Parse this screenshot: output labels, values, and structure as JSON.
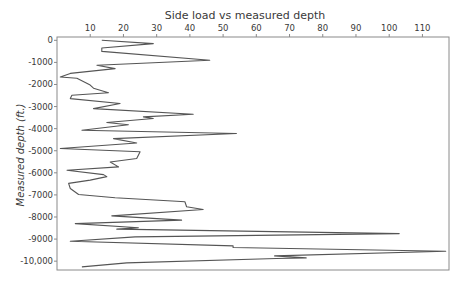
{
  "chart_data": {
    "type": "line",
    "title": "Side load vs measured depth",
    "xlabel": "",
    "ylabel": "Measured depth (ft.)",
    "xlim": [
      0,
      118
    ],
    "ylim": [
      -10400,
      150
    ],
    "x_axis_position": "top",
    "grid": false,
    "x_ticks": [
      10,
      20,
      30,
      40,
      50,
      60,
      70,
      80,
      90,
      100,
      110
    ],
    "x_tick_labels": [
      "10",
      "20",
      "30",
      "40",
      "50",
      "60",
      "70",
      "80",
      "90",
      "100",
      "110"
    ],
    "y_ticks": [
      0,
      -1000,
      -2000,
      -3000,
      -4000,
      -5000,
      -6000,
      -7000,
      -8000,
      -9000,
      -10000
    ],
    "y_tick_labels": [
      "0",
      "-1000",
      "-2000",
      "-3000",
      "-4000",
      "-5000",
      "-6000",
      "-7000",
      "-8000",
      "-9000",
      "-10,000"
    ],
    "series": [
      {
        "name": "Side load",
        "color": "#555555",
        "points": [
          [
            13.5,
            0
          ],
          [
            29,
            -150
          ],
          [
            13.5,
            -350
          ],
          [
            13.5,
            -500
          ],
          [
            46,
            -900
          ],
          [
            12,
            -1130
          ],
          [
            17.5,
            -1280
          ],
          [
            4,
            -1500
          ],
          [
            1,
            -1660
          ],
          [
            6,
            -1720
          ],
          [
            10,
            -2030
          ],
          [
            11,
            -2170
          ],
          [
            15.5,
            -2370
          ],
          [
            4.5,
            -2490
          ],
          [
            4,
            -2640
          ],
          [
            19,
            -2860
          ],
          [
            11,
            -3090
          ],
          [
            41,
            -3350
          ],
          [
            26,
            -3470
          ],
          [
            29,
            -3540
          ],
          [
            15,
            -3720
          ],
          [
            21.5,
            -3820
          ],
          [
            7.5,
            -4070
          ],
          [
            54,
            -4220
          ],
          [
            17,
            -4450
          ],
          [
            24,
            -4650
          ],
          [
            1,
            -4900
          ],
          [
            25,
            -5050
          ],
          [
            24,
            -5350
          ],
          [
            16,
            -5510
          ],
          [
            18.5,
            -5730
          ],
          [
            3,
            -5880
          ],
          [
            14,
            -6080
          ],
          [
            15,
            -6170
          ],
          [
            10,
            -6330
          ],
          [
            3.5,
            -6480
          ],
          [
            4,
            -6710
          ],
          [
            6.5,
            -6980
          ],
          [
            17.5,
            -7130
          ],
          [
            36,
            -7290
          ],
          [
            38.5,
            -7310
          ],
          [
            39,
            -7540
          ],
          [
            44,
            -7660
          ],
          [
            16.5,
            -7950
          ],
          [
            37.5,
            -8140
          ],
          [
            5.5,
            -8300
          ],
          [
            24.5,
            -8490
          ],
          [
            18,
            -8550
          ],
          [
            103,
            -8750
          ],
          [
            23.5,
            -8900
          ],
          [
            4,
            -9100
          ],
          [
            53,
            -9310
          ],
          [
            53,
            -9380
          ],
          [
            117,
            -9550
          ],
          [
            65.5,
            -9760
          ],
          [
            75,
            -9850
          ],
          [
            66,
            -9880
          ],
          [
            21,
            -10080
          ],
          [
            7.5,
            -10260
          ]
        ]
      }
    ]
  }
}
